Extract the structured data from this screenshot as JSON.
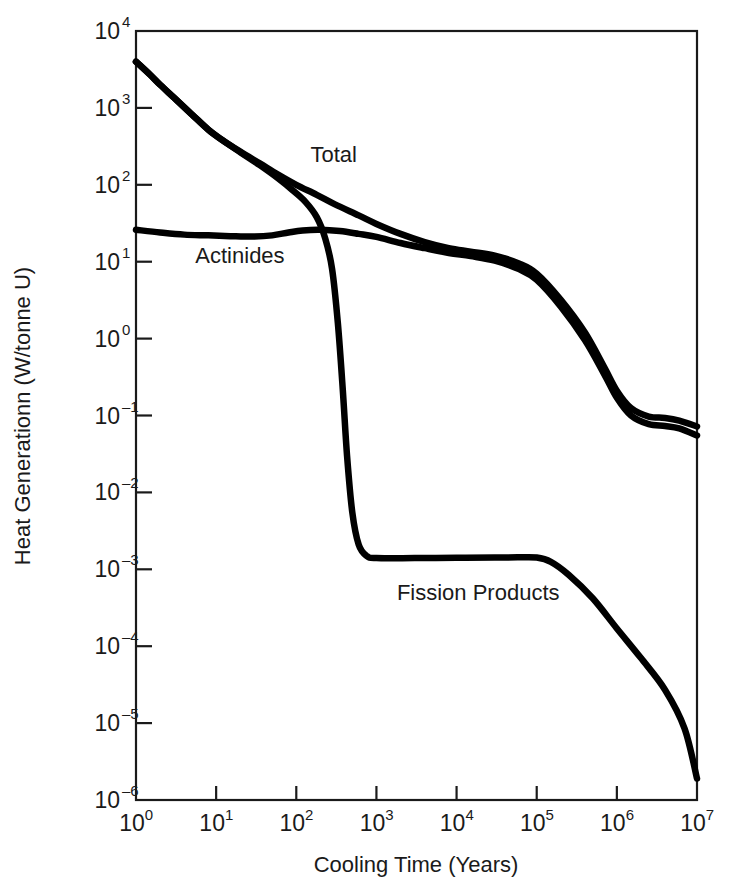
{
  "chart_data": {
    "type": "line",
    "title": "",
    "xlabel": "Cooling Time (Years)",
    "ylabel": "Heat Generationn (W/tonne U)",
    "xscale": "log",
    "yscale": "log",
    "xlim": [
      1,
      10000000
    ],
    "ylim": [
      1e-06,
      10000
    ],
    "grid": false,
    "legend_position": "inline-labels",
    "xtick_labels": [
      "10⁰",
      "10¹",
      "10²",
      "10³",
      "10⁴",
      "10⁵",
      "10⁶",
      "10⁷"
    ],
    "xtick_mantissas": [
      "10",
      "10",
      "10",
      "10",
      "10",
      "10",
      "10",
      "10"
    ],
    "xtick_exponents": [
      "0",
      "1",
      "2",
      "3",
      "4",
      "5",
      "6",
      "7"
    ],
    "xtick_values": [
      1,
      10,
      100,
      1000,
      10000,
      100000,
      1000000,
      10000000
    ],
    "ytick_mantissas": [
      "10",
      "10",
      "10",
      "10",
      "10",
      "10",
      "10",
      "10",
      "10",
      "10",
      "10"
    ],
    "ytick_exponents": [
      "4",
      "3",
      "2",
      "1",
      "0",
      "–1",
      "–2",
      "–3",
      "–4",
      "–5",
      "–6"
    ],
    "ytick_values": [
      10000,
      1000,
      100,
      10,
      1,
      0.1,
      0.01,
      0.001,
      0.0001,
      1e-05,
      1e-06
    ],
    "series": [
      {
        "name": "Total",
        "label": "Total",
        "label_x": 150,
        "label_y": 200,
        "color": "#000000",
        "linewidth": 6.5,
        "points": [
          [
            1,
            4000
          ],
          [
            1.5,
            2700
          ],
          [
            2,
            2000
          ],
          [
            3,
            1350
          ],
          [
            5,
            820
          ],
          [
            8,
            520
          ],
          [
            12,
            380
          ],
          [
            20,
            270
          ],
          [
            35,
            190
          ],
          [
            60,
            135
          ],
          [
            100,
            100
          ],
          [
            180,
            74
          ],
          [
            300,
            56
          ],
          [
            600,
            40
          ],
          [
            1000,
            31
          ],
          [
            2000,
            23
          ],
          [
            4000,
            18
          ],
          [
            8000,
            15
          ],
          [
            15000,
            13.5
          ],
          [
            30000,
            12
          ],
          [
            60000,
            9.5
          ],
          [
            100000,
            7
          ],
          [
            200000,
            3.2
          ],
          [
            400000,
            1.2
          ],
          [
            700000,
            0.42
          ],
          [
            1000000,
            0.21
          ],
          [
            1500000,
            0.125
          ],
          [
            2500000,
            0.097
          ],
          [
            4000000,
            0.093
          ],
          [
            6000000,
            0.086
          ],
          [
            10000000,
            0.072
          ]
        ]
      },
      {
        "name": "Actinides",
        "label": "Actinides",
        "label_x": 5.5,
        "label_y": 9.5,
        "color": "#000000",
        "linewidth": 6.5,
        "points": [
          [
            1,
            26
          ],
          [
            2,
            24
          ],
          [
            4,
            22.5
          ],
          [
            8,
            22
          ],
          [
            15,
            21.5
          ],
          [
            30,
            21.2
          ],
          [
            50,
            22
          ],
          [
            80,
            24
          ],
          [
            120,
            25.5
          ],
          [
            200,
            26
          ],
          [
            350,
            25
          ],
          [
            600,
            23
          ],
          [
            1000,
            21
          ],
          [
            2000,
            17.5
          ],
          [
            4000,
            15
          ],
          [
            8000,
            13
          ],
          [
            15000,
            11.8
          ],
          [
            30000,
            10.3
          ],
          [
            60000,
            8
          ],
          [
            100000,
            5.8
          ],
          [
            200000,
            2.6
          ],
          [
            400000,
            0.95
          ],
          [
            700000,
            0.34
          ],
          [
            1000000,
            0.17
          ],
          [
            1500000,
            0.1
          ],
          [
            2500000,
            0.077
          ],
          [
            4000000,
            0.073
          ],
          [
            6000000,
            0.068
          ],
          [
            10000000,
            0.055
          ]
        ]
      },
      {
        "name": "Fission Products",
        "label": "Fission Products",
        "label_x": 1800,
        "label_y": 0.0004,
        "color": "#000000",
        "linewidth": 6.5,
        "points": [
          [
            1,
            4000
          ],
          [
            1.5,
            2700
          ],
          [
            2,
            2000
          ],
          [
            3,
            1350
          ],
          [
            5,
            820
          ],
          [
            8,
            520
          ],
          [
            12,
            380
          ],
          [
            20,
            265
          ],
          [
            35,
            180
          ],
          [
            60,
            120
          ],
          [
            90,
            85
          ],
          [
            130,
            60
          ],
          [
            180,
            38
          ],
          [
            230,
            20
          ],
          [
            280,
            8
          ],
          [
            330,
            1.6
          ],
          [
            380,
            0.22
          ],
          [
            430,
            0.03
          ],
          [
            500,
            0.0055
          ],
          [
            600,
            0.0021
          ],
          [
            750,
            0.0015
          ],
          [
            1000,
            0.0014
          ],
          [
            3000,
            0.0014
          ],
          [
            10000,
            0.00141
          ],
          [
            30000,
            0.00142
          ],
          [
            60000,
            0.00143
          ],
          [
            100000,
            0.00142
          ],
          [
            150000,
            0.00125
          ],
          [
            250000,
            0.00085
          ],
          [
            500000,
            0.00042
          ],
          [
            1000000,
            0.00017
          ],
          [
            2000000,
            7e-05
          ],
          [
            4000000,
            2.7e-05
          ],
          [
            7000000,
            8.5e-06
          ],
          [
            10000000,
            1.9e-06
          ]
        ]
      }
    ]
  },
  "axes": {
    "x_title": "Cooling Time (Years)",
    "y_title": "Heat Generationn (W/tonne U)"
  }
}
